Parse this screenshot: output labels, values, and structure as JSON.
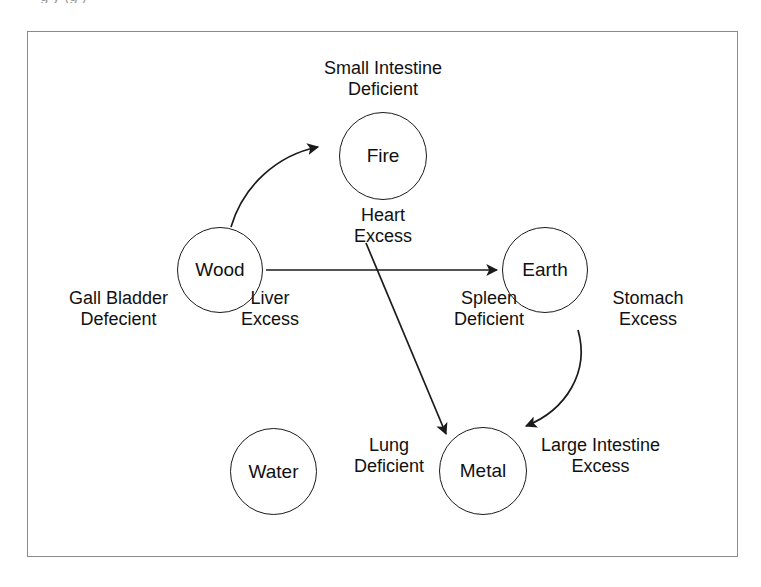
{
  "caption_fragment": "g  y (g  )",
  "figure": {
    "elements": [
      {
        "id": "fire",
        "label": "Fire"
      },
      {
        "id": "wood",
        "label": "Wood"
      },
      {
        "id": "earth",
        "label": "Earth"
      },
      {
        "id": "water",
        "label": "Water"
      },
      {
        "id": "metal",
        "label": "Metal"
      }
    ],
    "annotations": [
      {
        "id": "small-intestine",
        "organ": "Small Intestine",
        "state": "Deficient"
      },
      {
        "id": "heart",
        "organ": "Heart",
        "state": "Excess"
      },
      {
        "id": "gall-bladder",
        "organ": "Gall Bladder",
        "state": "Defecient"
      },
      {
        "id": "liver",
        "organ": "Liver",
        "state": "Excess"
      },
      {
        "id": "spleen",
        "organ": "Spleen",
        "state": "Deficient"
      },
      {
        "id": "stomach",
        "organ": "Stomach",
        "state": "Excess"
      },
      {
        "id": "lung",
        "organ": "Lung",
        "state": "Deficient"
      },
      {
        "id": "large-intestine",
        "organ": "Large Intestine",
        "state": "Excess"
      }
    ],
    "arrows": [
      {
        "id": "wood-to-fire",
        "from": "Wood",
        "to": "Fire",
        "style": "curved"
      },
      {
        "id": "wood-to-earth",
        "from": "Wood",
        "to": "Earth",
        "style": "straight"
      },
      {
        "id": "fire-to-metal",
        "from": "Fire",
        "to": "Metal",
        "style": "straight"
      },
      {
        "id": "earth-to-metal",
        "from": "Earth",
        "to": "Metal",
        "style": "curved"
      }
    ],
    "colors": {
      "stroke": "#1a1a1a",
      "frame": "#8a8a8a",
      "background": "#ffffff"
    }
  }
}
